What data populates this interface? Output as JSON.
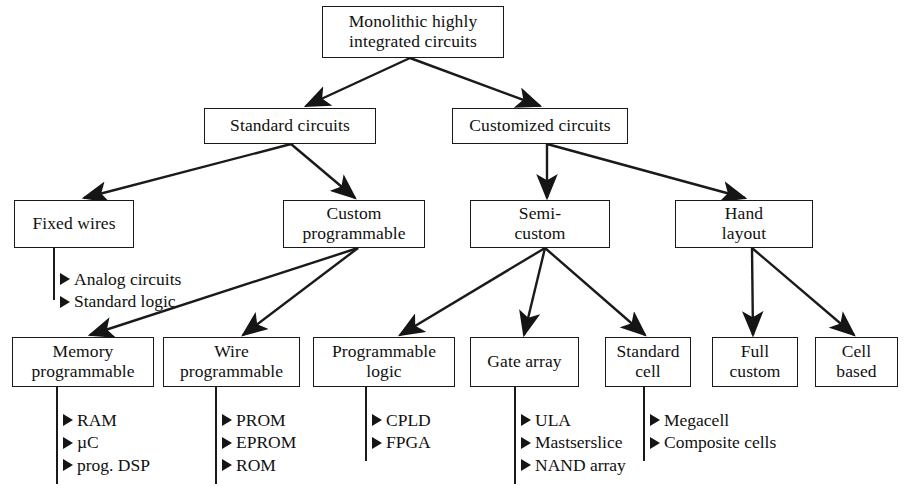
{
  "diagram": {
    "type": "tree-diagram",
    "stroke_color": "#1a1a1a",
    "background_color": "#ffffff",
    "bullet_glyph": "triangle-right",
    "nodes": [
      {
        "id": "root",
        "label": "Monolithic highly\nintegrated circuits",
        "x": 322,
        "y": 6,
        "w": 182,
        "h": 52
      },
      {
        "id": "standard",
        "label": "Standard circuits",
        "x": 204,
        "y": 108,
        "w": 172,
        "h": 36
      },
      {
        "id": "customized",
        "label": "Customized circuits",
        "x": 452,
        "y": 108,
        "w": 176,
        "h": 36
      },
      {
        "id": "fixedwires",
        "label": "Fixed wires",
        "x": 14,
        "y": 200,
        "w": 120,
        "h": 48
      },
      {
        "id": "custprog",
        "label": "Custom\nprogrammable",
        "x": 283,
        "y": 200,
        "w": 142,
        "h": 48
      },
      {
        "id": "semicustom",
        "label": "Semi-\ncustom",
        "x": 470,
        "y": 200,
        "w": 140,
        "h": 48
      },
      {
        "id": "handlayout",
        "label": "Hand\nlayout",
        "x": 675,
        "y": 200,
        "w": 138,
        "h": 48
      },
      {
        "id": "memprog",
        "label": "Memory\nprogrammable",
        "x": 12,
        "y": 337,
        "w": 142,
        "h": 50
      },
      {
        "id": "wireprog",
        "label": "Wire\nprogrammable",
        "x": 163,
        "y": 337,
        "w": 137,
        "h": 50
      },
      {
        "id": "proglogic",
        "label": "Programmable\nlogic",
        "x": 313,
        "y": 337,
        "w": 142,
        "h": 50
      },
      {
        "id": "gatearray",
        "label": "Gate array",
        "x": 470,
        "y": 337,
        "w": 109,
        "h": 50
      },
      {
        "id": "standardcell",
        "label": "Standard\ncell",
        "x": 605,
        "y": 337,
        "w": 86,
        "h": 50
      },
      {
        "id": "fullcustom",
        "label": "Full\ncustom",
        "x": 712,
        "y": 337,
        "w": 86,
        "h": 50
      },
      {
        "id": "cellbased",
        "label": "Cell\nbased",
        "x": 815,
        "y": 337,
        "w": 83,
        "h": 50
      }
    ],
    "bullet_groups": [
      {
        "id": "fixedwires-items",
        "x": 60,
        "y": 268,
        "stem": {
          "x": 54,
          "y1": 248,
          "y2": 300
        },
        "items": [
          "Analog circuits",
          "Standard logic"
        ]
      },
      {
        "id": "memprog-items",
        "x": 63,
        "y": 409,
        "stem": {
          "x": 57,
          "y1": 387,
          "y2": 484
        },
        "items": [
          "RAM",
          "µC",
          "prog. DSP"
        ]
      },
      {
        "id": "wireprog-items",
        "x": 222,
        "y": 409,
        "stem": {
          "x": 216,
          "y1": 387,
          "y2": 484
        },
        "items": [
          "PROM",
          "EPROM",
          "ROM"
        ]
      },
      {
        "id": "proglogic-items",
        "x": 372,
        "y": 409,
        "stem": {
          "x": 366,
          "y1": 387,
          "y2": 461
        },
        "items": [
          "CPLD",
          "FPGA"
        ]
      },
      {
        "id": "gatearray-items",
        "x": 521,
        "y": 409,
        "stem": {
          "x": 515,
          "y1": 387,
          "y2": 484
        },
        "items": [
          "ULA",
          "Mastserslice",
          "NAND array"
        ]
      },
      {
        "id": "standardcell-items",
        "x": 650,
        "y": 409,
        "stem": {
          "x": 644,
          "y1": 387,
          "y2": 461
        },
        "items": [
          "Megacell",
          "Composite cells"
        ]
      }
    ],
    "edges": [
      {
        "id": "root-standard",
        "from": "root",
        "to": "standard",
        "x1": 410,
        "y1": 58,
        "x2": 306,
        "y2": 106
      },
      {
        "id": "root-customized",
        "from": "root",
        "to": "customized",
        "x1": 410,
        "y1": 58,
        "x2": 540,
        "y2": 106
      },
      {
        "id": "standard-fixedwires",
        "from": "standard",
        "to": "fixedwires",
        "x1": 291,
        "y1": 144,
        "x2": 84,
        "y2": 198
      },
      {
        "id": "standard-custprog",
        "from": "standard",
        "to": "custprog",
        "x1": 291,
        "y1": 144,
        "x2": 355,
        "y2": 198
      },
      {
        "id": "customized-semicustom",
        "from": "customized",
        "to": "semicustom",
        "x1": 547,
        "y1": 144,
        "x2": 547,
        "y2": 198
      },
      {
        "id": "customized-handlayout",
        "from": "customized",
        "to": "handlayout",
        "x1": 547,
        "y1": 144,
        "x2": 745,
        "y2": 198
      },
      {
        "id": "custprog-memprog",
        "from": "custprog",
        "to": "memprog",
        "x1": 358,
        "y1": 248,
        "x2": 90,
        "y2": 335
      },
      {
        "id": "custprog-wireprog",
        "from": "custprog",
        "to": "wireprog",
        "x1": 358,
        "y1": 248,
        "x2": 243,
        "y2": 335
      },
      {
        "id": "semicustom-proglogic",
        "from": "semicustom",
        "to": "proglogic",
        "x1": 545,
        "y1": 248,
        "x2": 400,
        "y2": 335
      },
      {
        "id": "semicustom-gatearray",
        "from": "semicustom",
        "to": "gatearray",
        "x1": 545,
        "y1": 248,
        "x2": 524,
        "y2": 335
      },
      {
        "id": "semicustom-standardcell",
        "from": "semicustom",
        "to": "standardcell",
        "x1": 545,
        "y1": 248,
        "x2": 645,
        "y2": 335
      },
      {
        "id": "handlayout-fullcustom",
        "from": "handlayout",
        "to": "fullcustom",
        "x1": 752,
        "y1": 248,
        "x2": 753,
        "y2": 335
      },
      {
        "id": "handlayout-cellbased",
        "from": "handlayout",
        "to": "cellbased",
        "x1": 752,
        "y1": 248,
        "x2": 854,
        "y2": 335
      }
    ]
  }
}
